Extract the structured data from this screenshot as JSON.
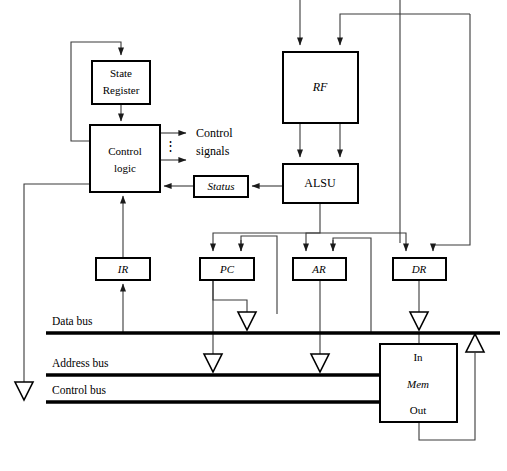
{
  "diagram": {
    "blocks": [
      {
        "id": "state_register",
        "label_line1": "State",
        "label_line2": "Register",
        "style": "plain",
        "x": 92,
        "y": 61,
        "w": 58,
        "h": 43
      },
      {
        "id": "control_logic",
        "label_line1": "Control",
        "label_line2": "logic",
        "style": "plain",
        "x": 90,
        "y": 125,
        "w": 70,
        "h": 67
      },
      {
        "id": "status",
        "label_line1": "Status",
        "style": "italic",
        "x": 194,
        "y": 176,
        "w": 54,
        "h": 21
      },
      {
        "id": "rf",
        "label_line1": "RF",
        "style": "italic",
        "x": 283,
        "y": 52,
        "w": 75,
        "h": 71
      },
      {
        "id": "alsu",
        "label_line1": "ALSU",
        "style": "plain",
        "x": 283,
        "y": 164,
        "w": 75,
        "h": 39
      },
      {
        "id": "ir",
        "label_line1": "IR",
        "style": "italic",
        "x": 96,
        "y": 258,
        "w": 54,
        "h": 22
      },
      {
        "id": "pc",
        "label_line1": "PC",
        "style": "italic",
        "x": 200,
        "y": 258,
        "w": 54,
        "h": 22
      },
      {
        "id": "ar",
        "label_line1": "AR",
        "style": "italic",
        "x": 293,
        "y": 258,
        "w": 53,
        "h": 22
      },
      {
        "id": "dr",
        "label_line1": "DR",
        "style": "italic",
        "x": 393,
        "y": 258,
        "w": 53,
        "h": 22
      },
      {
        "id": "mem",
        "label_line1": "Mem",
        "style": "italic",
        "x": 380,
        "y": 344,
        "w": 77,
        "h": 78
      }
    ],
    "annotations": {
      "control_signals_line1": "Control",
      "control_signals_line2": "signals",
      "control_signals_dots": "⋮",
      "mem_in": "In",
      "mem_out": "Out"
    },
    "buses": [
      {
        "id": "data_bus",
        "label": "Data bus",
        "y": 333,
        "x1": 46,
        "x2": 500,
        "label_x": 52,
        "label_y": 322
      },
      {
        "id": "address_bus",
        "label": "Address bus",
        "y": 375,
        "x1": 46,
        "x2": 382,
        "label_x": 52,
        "label_y": 364
      },
      {
        "id": "control_bus",
        "label": "Control bus",
        "y": 402,
        "x1": 46,
        "x2": 382,
        "label_x": 52,
        "label_y": 391
      }
    ],
    "colors": {
      "background": "#ffffff",
      "box_stroke": "#000000",
      "wire": "#3a3a3a",
      "bus": "#000000",
      "text": "#000000"
    }
  }
}
